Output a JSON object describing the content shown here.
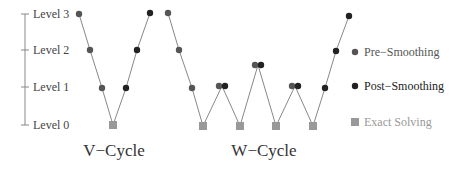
{
  "axis": {
    "x": 25,
    "levels": [
      {
        "label": "Level 3",
        "y": 14
      },
      {
        "label": "Level 2",
        "y": 50
      },
      {
        "label": "Level 1",
        "y": 87
      },
      {
        "label": "Level 0",
        "y": 125
      }
    ],
    "color": "#888888",
    "label_color": "#444444"
  },
  "cycles": [
    {
      "name": "V-Cycle",
      "title": "V−Cycle",
      "title_pos": [
        114,
        156
      ],
      "path": [
        [
          79,
          14
        ],
        [
          90,
          50
        ],
        [
          102,
          88
        ],
        [
          113,
          125
        ],
        [
          126,
          88
        ],
        [
          137,
          50
        ],
        [
          150,
          13
        ]
      ],
      "markers": [
        {
          "type": "pre",
          "x": 79,
          "y": 14
        },
        {
          "type": "pre",
          "x": 90,
          "y": 50
        },
        {
          "type": "pre",
          "x": 102,
          "y": 88
        },
        {
          "type": "exact",
          "x": 113,
          "y": 125
        },
        {
          "type": "post",
          "x": 126,
          "y": 88
        },
        {
          "type": "post",
          "x": 137,
          "y": 50
        },
        {
          "type": "post",
          "x": 150,
          "y": 13
        }
      ]
    },
    {
      "name": "W-Cycle",
      "title": "W−Cycle",
      "title_pos": [
        264,
        156
      ],
      "path": [
        [
          168,
          13
        ],
        [
          179,
          50
        ],
        [
          192,
          88
        ],
        [
          203,
          126
        ],
        [
          222,
          86
        ],
        [
          240,
          126
        ],
        [
          258,
          65
        ],
        [
          276,
          126
        ],
        [
          295,
          86
        ],
        [
          313,
          126
        ],
        [
          325,
          88
        ],
        [
          336,
          51
        ],
        [
          349,
          16
        ]
      ],
      "markers": [
        {
          "type": "pre",
          "x": 168,
          "y": 13
        },
        {
          "type": "pre",
          "x": 179,
          "y": 50
        },
        {
          "type": "pre",
          "x": 192,
          "y": 88
        },
        {
          "type": "exact",
          "x": 203,
          "y": 126
        },
        {
          "type": "pre",
          "x": 219,
          "y": 86
        },
        {
          "type": "post",
          "x": 225,
          "y": 86
        },
        {
          "type": "exact",
          "x": 240,
          "y": 126
        },
        {
          "type": "pre",
          "x": 255,
          "y": 65
        },
        {
          "type": "post",
          "x": 261,
          "y": 65
        },
        {
          "type": "exact",
          "x": 276,
          "y": 126
        },
        {
          "type": "pre",
          "x": 292,
          "y": 86
        },
        {
          "type": "post",
          "x": 298,
          "y": 86
        },
        {
          "type": "exact",
          "x": 313,
          "y": 126
        },
        {
          "type": "post",
          "x": 325,
          "y": 88
        },
        {
          "type": "post",
          "x": 336,
          "y": 51
        },
        {
          "type": "post",
          "x": 349,
          "y": 16
        }
      ]
    }
  ],
  "legend": {
    "items": [
      {
        "type": "pre",
        "label": "Pre−Smoothing",
        "y": 52,
        "text_color": "#555555"
      },
      {
        "type": "post",
        "label": "Post−Smoothing",
        "y": 86,
        "text_color": "#222222"
      },
      {
        "type": "exact",
        "label": "Exact Solving",
        "y": 122,
        "text_color": "#999999"
      }
    ],
    "marker_x": 355,
    "text_x": 364
  },
  "styles": {
    "pre": {
      "color": "#555555",
      "radius": 3.2
    },
    "post": {
      "color": "#222222",
      "radius": 3.2
    },
    "exact": {
      "color": "#999999",
      "size": 8
    },
    "line_color": "#888888"
  }
}
